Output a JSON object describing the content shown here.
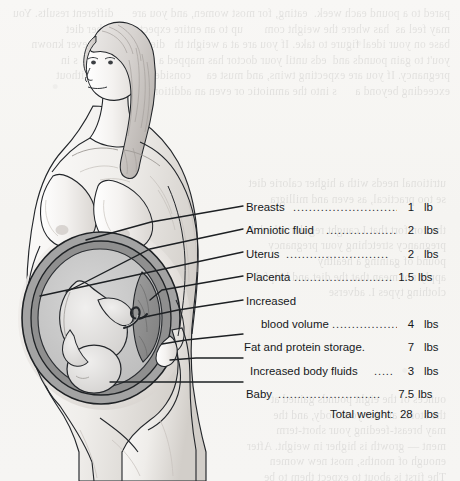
{
  "figure": {
    "style": "grayscale pencil line illustration on scanned book page"
  },
  "colors": {
    "page_background": "#f6f5f3",
    "ink": "#15181b",
    "leader_line": "#1d2023",
    "skin_light": "#f3f1ef",
    "skin_shade": "#d8d4d0",
    "hair": "#d2cecb",
    "uterus_wall": "#9a9a9a",
    "amniotic_cavity": "#c6c6c6",
    "placenta": "#8e8e8e",
    "fetus": "#e2e0de",
    "bleed_text": "#000000"
  },
  "labels": [
    {
      "name": "Breasts",
      "dots": "............................",
      "value": "1",
      "unit": "lb",
      "indent": false
    },
    {
      "name": "Amniotic fluid",
      "dots": "..................",
      "value": "2",
      "unit": "lbs",
      "indent": false
    },
    {
      "name": "Uterus",
      "dots": "..........................",
      "value": "2",
      "unit": "lbs",
      "indent": false
    },
    {
      "name": "Placenta",
      "dots": ".........................",
      "value": "1.5",
      "unit": "lbs",
      "indent": false
    },
    {
      "name": "Increased",
      "dots": "",
      "value": "",
      "unit": "",
      "indent": false
    },
    {
      "name": "blood volume",
      "dots": "..................",
      "value": "4",
      "unit": "lbs",
      "indent": true
    },
    {
      "name": "Fat and protein storage.",
      "dots": "",
      "value": "7",
      "unit": "lbs",
      "indent": false
    },
    {
      "name": "Increased body fluids",
      "dots": ".....",
      "value": "3",
      "unit": "lbs",
      "indent": false
    },
    {
      "name": "Baby",
      "dots": "..........................",
      "value": "7.5",
      "unit": "lbs",
      "indent": false
    }
  ],
  "total": {
    "label": "Total weight:",
    "value": "28",
    "unit": "lbs"
  },
  "bleed_through_text": {
    "top": "pared to a pound each week.  eating, for most women, and you are      different results. You may feel as  has where the weight com       up to an entire expectant-mother diet                 base on your ideal figure to take. If you are at a weight th   diet. You have never known you't to gain pounds and  eds until your doctor has mapped a round of regul   s in pregnancy. If you are expecting twins, and must ea     consider body build without exceeding beyond a      s into the amniotic or even an additional tissue m",
    "middle": "utritional needs with a higher calorie diet\nse too practical, as even and milligra\n\nthe comfort that I caught regular schedul\npregnancy stretching your pregnancy\npound of gaining a healthy\napply not mean that the diet and helpful e\nclothing types I. adverse",
    "bottom": "ounces of the eight pounds gained at\nthe stores are for your body, and the\nmay breast-feeding your short-term\nment — growth is higher in weight. After\nenough of months, most new women\nThe first is about to expect them to be\npounds after the baby before a lift because"
  }
}
